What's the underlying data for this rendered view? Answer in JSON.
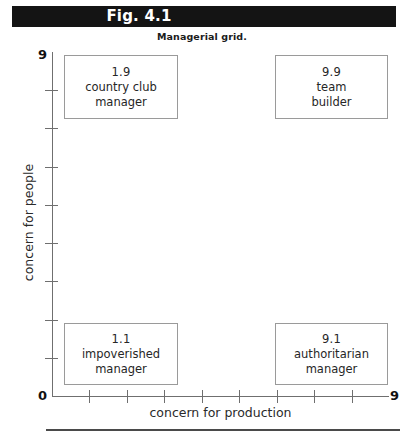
{
  "figure": {
    "bar_label": "Fig. 4.1",
    "subtitle": "Managerial grid.",
    "bar_color": "#141414",
    "bar_text_color": "#ffffff"
  },
  "chart_data": {
    "type": "scatter",
    "title": "Fig. 4.1",
    "subtitle": "Managerial grid.",
    "xlabel": "concern for production",
    "ylabel": "concern for people",
    "xlim": [
      0,
      9
    ],
    "ylim": [
      0,
      9
    ],
    "xticks": [
      0,
      1,
      2,
      3,
      4,
      5,
      6,
      7,
      8,
      9
    ],
    "yticks": [
      0,
      1,
      2,
      3,
      4,
      5,
      6,
      7,
      8,
      9
    ],
    "xtick_labels_shown": [
      "0",
      "9"
    ],
    "ytick_labels_shown": [
      "0",
      "9"
    ],
    "grid": false,
    "legend": "none",
    "points": [
      {
        "coord": "1.9",
        "x": 1,
        "y": 9,
        "name_line1": "country club",
        "name_line2": "manager",
        "position": "top-left"
      },
      {
        "coord": "9.9",
        "x": 9,
        "y": 9,
        "name_line1": "team",
        "name_line2": "builder",
        "position": "top-right"
      },
      {
        "coord": "1.1",
        "x": 1,
        "y": 1,
        "name_line1": "impoverished",
        "name_line2": "manager",
        "position": "bottom-left"
      },
      {
        "coord": "9.1",
        "x": 9,
        "y": 1,
        "name_line1": "authoritarian",
        "name_line2": "manager",
        "position": "bottom-right"
      }
    ]
  },
  "axes": {
    "y_max_label": "9",
    "y_min_label": "0",
    "x_max_label": "9",
    "x_label": "concern for production",
    "y_label": "concern for people",
    "tick_count_interior": 8,
    "axis_color": "#6f6f6f"
  },
  "boxes": {
    "top_left": {
      "coord": "1.9",
      "line1": "country club",
      "line2": "manager"
    },
    "top_right": {
      "coord": "9.9",
      "line1": "team",
      "line2": "builder"
    },
    "bottom_left": {
      "coord": "1.1",
      "line1": "impoverished",
      "line2": "manager"
    },
    "bottom_right": {
      "coord": "9.1",
      "line1": "authoritarian",
      "line2": "manager"
    }
  }
}
